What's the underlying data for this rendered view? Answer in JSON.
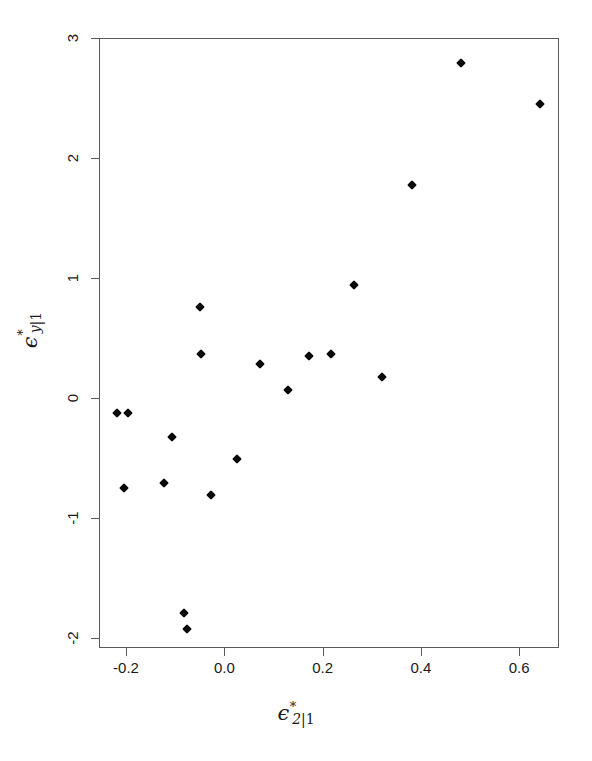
{
  "chart_data": {
    "type": "scatter",
    "title": "",
    "subtitle": "",
    "xlabel": "ϵ*_{2|1}",
    "ylabel": "ϵ*_{y|1}",
    "xlabel_parts": {
      "base": "ϵ",
      "sup": "*",
      "sub": "2",
      "sub_suffix": "|1"
    },
    "ylabel_parts": {
      "base": "ϵ",
      "sup": "*",
      "sub": "y",
      "sub_suffix": "|1"
    },
    "xlim": [
      -0.255,
      0.681
    ],
    "ylim": [
      -2.082,
      3.0
    ],
    "xticks": [
      -0.2,
      0.0,
      0.2,
      0.4,
      0.6
    ],
    "xticklabels": [
      "-0.2",
      "0.0",
      "0.2",
      "0.4",
      "0.6"
    ],
    "yticks": [
      3,
      2,
      1,
      0,
      -1,
      -2
    ],
    "yticklabels": [
      "3",
      "2",
      "1",
      "0",
      "-1",
      "-2"
    ],
    "grid": false,
    "legend": null,
    "marker": "filled-diamond",
    "marker_color": "#0a0a0a",
    "marker_size": 7,
    "n_points": 19,
    "x": [
      -0.222,
      -0.221,
      -0.202,
      -0.135,
      -0.132,
      -0.104,
      -0.096,
      -0.092,
      -0.055,
      -0.053,
      -0.03,
      0.002,
      0.046,
      0.051,
      0.1,
      0.145,
      0.23,
      0.281,
      0.337,
      0.434,
      0.582
    ],
    "y": [
      -0.69,
      -0.065,
      -0.065,
      -0.665,
      -0.275,
      -1.745,
      -1.88,
      -0.275,
      0.775,
      0.385,
      -0.745,
      -0.455,
      0.31,
      0.325,
      0.12,
      0.385,
      0.98,
      0.22,
      1.82,
      2.83,
      2.48
    ],
    "points": [
      {
        "x": -0.222,
        "y": -0.065,
        "px": 116,
        "py": 412
      },
      {
        "x": -0.2,
        "y": -0.065,
        "px": 127,
        "py": 412
      },
      {
        "x": -0.208,
        "y": -0.69,
        "px": 123,
        "py": 487
      },
      {
        "x": -0.135,
        "y": -0.665,
        "px": 163,
        "py": 482
      },
      {
        "x": -0.11,
        "y": -0.275,
        "px": 171,
        "py": 436
      },
      {
        "x": -0.086,
        "y": -1.745,
        "px": 183,
        "py": 612
      },
      {
        "x": -0.08,
        "y": -1.88,
        "px": 186,
        "py": 628
      },
      {
        "x": -0.053,
        "y": 0.775,
        "px": 199,
        "py": 306
      },
      {
        "x": -0.051,
        "y": 0.385,
        "px": 200,
        "py": 353
      },
      {
        "x": -0.03,
        "y": -0.745,
        "px": 210,
        "py": 494
      },
      {
        "x": 0.002,
        "y": -0.455,
        "px": 236,
        "py": 458
      },
      {
        "x": 0.022,
        "y": 0.31,
        "px": 259,
        "py": 363
      },
      {
        "x": 0.051,
        "y": 0.325,
        "px": 287,
        "py": 389
      },
      {
        "x": 0.1,
        "y": 0.12,
        "px": 308,
        "py": 355
      },
      {
        "x": 0.145,
        "y": 0.385,
        "px": 330,
        "py": 353
      },
      {
        "x": 0.23,
        "y": 0.98,
        "px": 353,
        "py": 284
      },
      {
        "x": 0.281,
        "y": 0.22,
        "px": 381,
        "py": 376
      },
      {
        "x": 0.337,
        "y": 1.82,
        "px": 411,
        "py": 184
      },
      {
        "x": 0.434,
        "y": 2.83,
        "px": 460,
        "py": 62
      },
      {
        "x": 0.582,
        "y": 2.48,
        "px": 539,
        "py": 103
      }
    ]
  },
  "figure": {
    "background_color": "#ffffff",
    "frame_color": "#5a5a5a",
    "text_color": "#1a1a1a"
  }
}
